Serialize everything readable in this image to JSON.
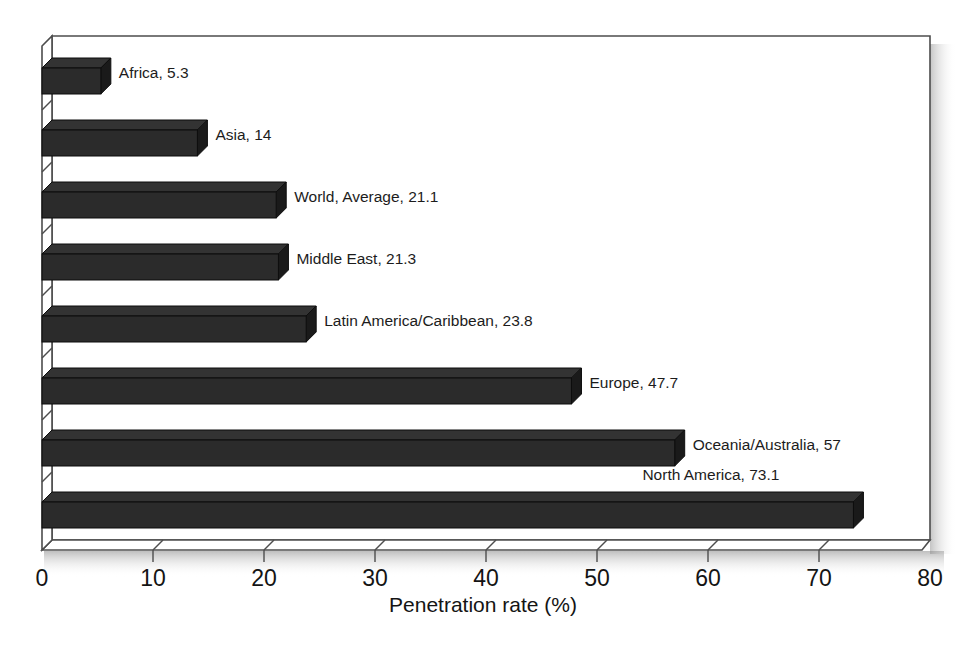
{
  "chart_data": {
    "type": "bar",
    "orientation": "horizontal",
    "style": "3d",
    "title": "",
    "subtitle": "",
    "xlabel": "Penetration rate (%)",
    "ylabel": "",
    "xlim": [
      0,
      80
    ],
    "xticks": [
      "0",
      "10",
      "20",
      "30",
      "40",
      "50",
      "60",
      "70",
      "80"
    ],
    "xtick_values": [
      0,
      10,
      20,
      30,
      40,
      50,
      60,
      70,
      80
    ],
    "grid": false,
    "legend": "none",
    "bar_color": "#2b2b2b",
    "bar_top_color": "#333333",
    "bar_side_color": "#1a1a1a",
    "frame_color": "#4d4d4d",
    "background": "#ffffff",
    "categories": [
      "Africa",
      "Asia",
      "World, Average",
      "Middle East",
      "Latin America/Caribbean",
      "Europe",
      "Oceania/Australia",
      "North America"
    ],
    "values": [
      5.3,
      14,
      21.1,
      21.3,
      23.8,
      47.7,
      57,
      73.1
    ],
    "point_labels": [
      "Africa, 5.3",
      "Asia, 14",
      "World, Average, 21.1",
      "Middle East, 21.3",
      "Latin America/Caribbean, 23.8",
      "Europe, 47.7",
      "Oceania/Australia, 57",
      "North America, 73.1"
    ],
    "label_positions": [
      "right-of-bar",
      "right-of-bar",
      "right-of-bar",
      "right-of-bar",
      "right-of-bar",
      "right-of-bar",
      "right-of-bar",
      "above-bar"
    ]
  }
}
